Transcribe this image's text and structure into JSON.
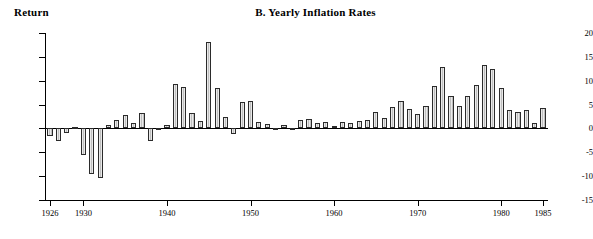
{
  "chart_data": {
    "type": "bar",
    "title": "B.  Yearly Inflation Rates",
    "ylabel": "Return",
    "xlabel": "",
    "ylim": [
      -15,
      20
    ],
    "yticks": [
      20,
      15,
      10,
      5,
      0,
      -5,
      -10,
      -15
    ],
    "xticks": [
      1926,
      1930,
      1940,
      1950,
      1960,
      1970,
      1980,
      1985
    ],
    "grid": false,
    "legend": null,
    "xlim": [
      1925.4,
      1985.6
    ],
    "categories": [
      1926,
      1927,
      1928,
      1929,
      1930,
      1931,
      1932,
      1933,
      1934,
      1935,
      1936,
      1937,
      1938,
      1939,
      1940,
      1941,
      1942,
      1943,
      1944,
      1945,
      1946,
      1947,
      1948,
      1949,
      1950,
      1951,
      1952,
      1953,
      1954,
      1955,
      1956,
      1957,
      1958,
      1959,
      1960,
      1961,
      1962,
      1963,
      1964,
      1965,
      1966,
      1967,
      1968,
      1969,
      1970,
      1971,
      1972,
      1973,
      1974,
      1975,
      1976,
      1977,
      1978,
      1979,
      1980,
      1981,
      1982,
      1983,
      1984,
      1985
    ],
    "values": [
      -1.5,
      -2.6,
      -0.9,
      0.2,
      -5.5,
      -9.6,
      -10.4,
      0.8,
      1.8,
      2.9,
      1.2,
      3.2,
      -2.6,
      -0.4,
      0.8,
      9.4,
      8.7,
      3.2,
      1.6,
      18.2,
      8.4,
      2.4,
      -1.2,
      5.5,
      5.7,
      1.3,
      0.9,
      -0.4,
      0.7,
      -0.3,
      1.7,
      1.9,
      1.1,
      1.3,
      0.6,
      1.4,
      1.1,
      1.5,
      1.8,
      3.4,
      2.2,
      4.5,
      5.7,
      4.0,
      3.0,
      4.8,
      8.9,
      12.8,
      6.8,
      4.8,
      6.8,
      9.0,
      13.3,
      12.5,
      8.4,
      3.8,
      3.5,
      3.9,
      1.1,
      4.2
    ]
  }
}
